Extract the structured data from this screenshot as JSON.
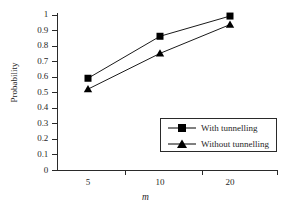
{
  "chart_data": {
    "type": "line",
    "title": "",
    "xlabel": "m",
    "ylabel": "Probability",
    "categories": [
      "5",
      "10",
      "20"
    ],
    "x_tick_labels": [
      "5",
      "10",
      "20"
    ],
    "y_tick_labels": [
      "0",
      "0.1",
      "0.2",
      "0.3",
      "0.4",
      "0.5",
      "0.6",
      "0.7",
      "0.8",
      "0.9",
      "1"
    ],
    "ylim": [
      0,
      1
    ],
    "ytick_step": 0.1,
    "grid": false,
    "legend_position": "lower-right-inside",
    "series": [
      {
        "name": "With tunnelling",
        "marker": "square",
        "color": "#000000",
        "values": [
          0.59,
          0.86,
          0.99
        ]
      },
      {
        "name": "Without tunnelling",
        "marker": "triangle",
        "color": "#000000",
        "values": [
          0.52,
          0.75,
          0.935
        ]
      }
    ]
  },
  "axes": {
    "y_title": "Probability",
    "x_title": "m"
  },
  "legend": {
    "entries": [
      {
        "label": "With tunnelling",
        "marker": "square"
      },
      {
        "label": "Without tunnelling",
        "marker": "triangle"
      }
    ]
  },
  "colors": {
    "ink": "#1f1f1f",
    "axis": "#2a2a2a",
    "background": "#ffffff",
    "series": "#000000"
  }
}
